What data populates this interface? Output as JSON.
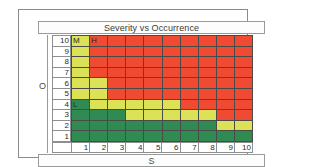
{
  "chart_data": {
    "type": "heatmap",
    "title": "Severity vs Occurrence",
    "xlabel": "S",
    "ylabel": "O",
    "x_tick_labels": [
      "1",
      "2",
      "3",
      "4",
      "5",
      "6",
      "7",
      "8",
      "9",
      "10"
    ],
    "y_tick_labels": [
      "10",
      "9",
      "8",
      "7",
      "6",
      "5",
      "4",
      "3",
      "2",
      "1"
    ],
    "xlim": [
      1,
      10
    ],
    "ylim": [
      1,
      10
    ],
    "grid": true,
    "legend": "none",
    "risk_levels": {
      "high": "H",
      "medium": "M",
      "low": "L"
    },
    "colors": {
      "high": "#F04A32",
      "medium": "#DCE256",
      "low": "#2F8B52",
      "gridline": "#4A4A4A",
      "frame": "#8A8A8A",
      "text": "#2B2B2B"
    },
    "rows": [
      {
        "y": "10",
        "cells": [
          {
            "x": "1",
            "level": "medium",
            "label": "M"
          },
          {
            "x": "2",
            "level": "high",
            "label": "H"
          },
          {
            "x": "3",
            "level": "high",
            "label": ""
          },
          {
            "x": "4",
            "level": "high",
            "label": ""
          },
          {
            "x": "5",
            "level": "high",
            "label": ""
          },
          {
            "x": "6",
            "level": "high",
            "label": ""
          },
          {
            "x": "7",
            "level": "high",
            "label": ""
          },
          {
            "x": "8",
            "level": "high",
            "label": ""
          },
          {
            "x": "9",
            "level": "high",
            "label": ""
          },
          {
            "x": "10",
            "level": "high",
            "label": ""
          }
        ]
      },
      {
        "y": "9",
        "cells": [
          {
            "x": "1",
            "level": "medium",
            "label": ""
          },
          {
            "x": "2",
            "level": "high",
            "label": ""
          },
          {
            "x": "3",
            "level": "high",
            "label": ""
          },
          {
            "x": "4",
            "level": "high",
            "label": ""
          },
          {
            "x": "5",
            "level": "high",
            "label": ""
          },
          {
            "x": "6",
            "level": "high",
            "label": ""
          },
          {
            "x": "7",
            "level": "high",
            "label": ""
          },
          {
            "x": "8",
            "level": "high",
            "label": ""
          },
          {
            "x": "9",
            "level": "high",
            "label": ""
          },
          {
            "x": "10",
            "level": "high",
            "label": ""
          }
        ]
      },
      {
        "y": "8",
        "cells": [
          {
            "x": "1",
            "level": "medium",
            "label": ""
          },
          {
            "x": "2",
            "level": "high",
            "label": ""
          },
          {
            "x": "3",
            "level": "high",
            "label": ""
          },
          {
            "x": "4",
            "level": "high",
            "label": ""
          },
          {
            "x": "5",
            "level": "high",
            "label": ""
          },
          {
            "x": "6",
            "level": "high",
            "label": ""
          },
          {
            "x": "7",
            "level": "high",
            "label": ""
          },
          {
            "x": "8",
            "level": "high",
            "label": ""
          },
          {
            "x": "9",
            "level": "high",
            "label": ""
          },
          {
            "x": "10",
            "level": "high",
            "label": ""
          }
        ]
      },
      {
        "y": "7",
        "cells": [
          {
            "x": "1",
            "level": "medium",
            "label": ""
          },
          {
            "x": "2",
            "level": "high",
            "label": ""
          },
          {
            "x": "3",
            "level": "high",
            "label": ""
          },
          {
            "x": "4",
            "level": "high",
            "label": ""
          },
          {
            "x": "5",
            "level": "high",
            "label": ""
          },
          {
            "x": "6",
            "level": "high",
            "label": ""
          },
          {
            "x": "7",
            "level": "high",
            "label": ""
          },
          {
            "x": "8",
            "level": "high",
            "label": ""
          },
          {
            "x": "9",
            "level": "high",
            "label": ""
          },
          {
            "x": "10",
            "level": "high",
            "label": ""
          }
        ]
      },
      {
        "y": "6",
        "cells": [
          {
            "x": "1",
            "level": "medium",
            "label": ""
          },
          {
            "x": "2",
            "level": "medium",
            "label": ""
          },
          {
            "x": "3",
            "level": "high",
            "label": ""
          },
          {
            "x": "4",
            "level": "high",
            "label": ""
          },
          {
            "x": "5",
            "level": "high",
            "label": ""
          },
          {
            "x": "6",
            "level": "high",
            "label": ""
          },
          {
            "x": "7",
            "level": "high",
            "label": ""
          },
          {
            "x": "8",
            "level": "high",
            "label": ""
          },
          {
            "x": "9",
            "level": "high",
            "label": ""
          },
          {
            "x": "10",
            "level": "high",
            "label": ""
          }
        ]
      },
      {
        "y": "5",
        "cells": [
          {
            "x": "1",
            "level": "medium",
            "label": ""
          },
          {
            "x": "2",
            "level": "medium",
            "label": ""
          },
          {
            "x": "3",
            "level": "high",
            "label": ""
          },
          {
            "x": "4",
            "level": "high",
            "label": ""
          },
          {
            "x": "5",
            "level": "high",
            "label": ""
          },
          {
            "x": "6",
            "level": "high",
            "label": ""
          },
          {
            "x": "7",
            "level": "high",
            "label": ""
          },
          {
            "x": "8",
            "level": "high",
            "label": ""
          },
          {
            "x": "9",
            "level": "high",
            "label": ""
          },
          {
            "x": "10",
            "level": "high",
            "label": ""
          }
        ]
      },
      {
        "y": "4",
        "cells": [
          {
            "x": "1",
            "level": "low",
            "label": "L"
          },
          {
            "x": "2",
            "level": "medium",
            "label": ""
          },
          {
            "x": "3",
            "level": "medium",
            "label": ""
          },
          {
            "x": "4",
            "level": "medium",
            "label": ""
          },
          {
            "x": "5",
            "level": "medium",
            "label": ""
          },
          {
            "x": "6",
            "level": "medium",
            "label": ""
          },
          {
            "x": "7",
            "level": "high",
            "label": ""
          },
          {
            "x": "8",
            "level": "high",
            "label": ""
          },
          {
            "x": "9",
            "level": "high",
            "label": ""
          },
          {
            "x": "10",
            "level": "high",
            "label": ""
          }
        ]
      },
      {
        "y": "3",
        "cells": [
          {
            "x": "1",
            "level": "low",
            "label": ""
          },
          {
            "x": "2",
            "level": "low",
            "label": ""
          },
          {
            "x": "3",
            "level": "low",
            "label": ""
          },
          {
            "x": "4",
            "level": "medium",
            "label": ""
          },
          {
            "x": "5",
            "level": "medium",
            "label": ""
          },
          {
            "x": "6",
            "level": "medium",
            "label": ""
          },
          {
            "x": "7",
            "level": "medium",
            "label": ""
          },
          {
            "x": "8",
            "level": "medium",
            "label": ""
          },
          {
            "x": "9",
            "level": "high",
            "label": ""
          },
          {
            "x": "10",
            "level": "high",
            "label": ""
          }
        ]
      },
      {
        "y": "2",
        "cells": [
          {
            "x": "1",
            "level": "low",
            "label": ""
          },
          {
            "x": "2",
            "level": "low",
            "label": ""
          },
          {
            "x": "3",
            "level": "low",
            "label": ""
          },
          {
            "x": "4",
            "level": "low",
            "label": ""
          },
          {
            "x": "5",
            "level": "low",
            "label": ""
          },
          {
            "x": "6",
            "level": "low",
            "label": ""
          },
          {
            "x": "7",
            "level": "low",
            "label": ""
          },
          {
            "x": "8",
            "level": "low",
            "label": ""
          },
          {
            "x": "9",
            "level": "medium",
            "label": ""
          },
          {
            "x": "10",
            "level": "medium",
            "label": ""
          }
        ]
      },
      {
        "y": "1",
        "cells": [
          {
            "x": "1",
            "level": "low",
            "label": ""
          },
          {
            "x": "2",
            "level": "low",
            "label": ""
          },
          {
            "x": "3",
            "level": "low",
            "label": ""
          },
          {
            "x": "4",
            "level": "low",
            "label": ""
          },
          {
            "x": "5",
            "level": "low",
            "label": ""
          },
          {
            "x": "6",
            "level": "low",
            "label": ""
          },
          {
            "x": "7",
            "level": "low",
            "label": ""
          },
          {
            "x": "8",
            "level": "low",
            "label": ""
          },
          {
            "x": "9",
            "level": "low",
            "label": ""
          },
          {
            "x": "10",
            "level": "low",
            "label": ""
          }
        ]
      }
    ]
  }
}
